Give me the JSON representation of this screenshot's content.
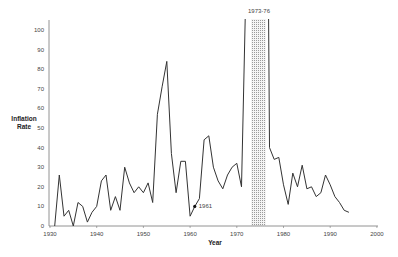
{
  "chart_data": {
    "type": "line",
    "title": "",
    "xlabel": "Year",
    "ylabel": "Inflation Rate",
    "ylim": [
      0,
      105
    ],
    "xlim": [
      1930,
      2000
    ],
    "grid": false,
    "legend": null,
    "y_ticks": [
      "0",
      "10",
      "20",
      "30",
      "40",
      "50",
      "60",
      "70",
      "80",
      "90",
      "100"
    ],
    "x_ticks": [
      "1930",
      "1940",
      "1950",
      "1960",
      "1970",
      "1980",
      "1990",
      "2000"
    ],
    "annotations": [
      {
        "text": "1961",
        "x": 1961,
        "y": 10,
        "marker": "dot"
      },
      {
        "text": "1973-76",
        "x_start": 1973,
        "x_end": 1976,
        "note": "shaded band; values exceed top of axis"
      }
    ],
    "series": [
      {
        "name": "Inflation Rate",
        "x": [
          1931,
          1932,
          1933,
          1934,
          1935,
          1936,
          1937,
          1938,
          1939,
          1940,
          1941,
          1942,
          1943,
          1944,
          1945,
          1946,
          1947,
          1948,
          1949,
          1950,
          1951,
          1952,
          1953,
          1954,
          1955,
          1956,
          1957,
          1958,
          1959,
          1960,
          1961,
          1962,
          1963,
          1964,
          1965,
          1966,
          1967,
          1968,
          1969,
          1970,
          1971,
          1972,
          1977,
          1978,
          1979,
          1980,
          1981,
          1982,
          1983,
          1984,
          1985,
          1986,
          1987,
          1988,
          1989,
          1990,
          1991,
          1992,
          1993,
          1994
        ],
        "values": [
          0,
          26,
          5,
          8,
          0,
          12,
          10,
          2,
          7,
          10,
          23,
          26,
          8,
          15,
          8,
          30,
          22,
          17,
          20,
          17,
          22,
          12,
          57,
          71,
          84,
          37,
          17,
          33,
          33,
          5,
          10,
          14,
          44,
          46,
          30,
          23,
          19,
          26,
          30,
          32,
          20,
          106,
          40,
          34,
          35,
          21,
          11,
          27,
          20,
          31,
          19,
          20,
          15,
          17,
          26,
          21,
          15,
          12,
          8,
          7
        ]
      }
    ]
  },
  "labels": {
    "y_axis": [
      "Inflation",
      "Rate"
    ],
    "x_axis": "Year",
    "band_label": "1973-76",
    "point_label": "1961"
  }
}
